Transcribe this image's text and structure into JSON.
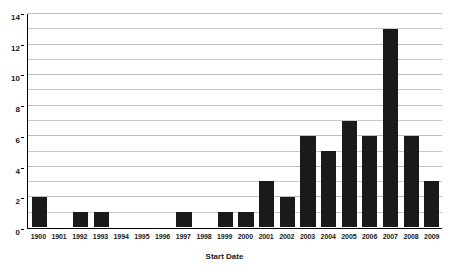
{
  "chart_data": {
    "type": "bar",
    "title": "",
    "xlabel": "Start Date",
    "ylabel": "",
    "categories": [
      "1900",
      "1901",
      "1992",
      "1993",
      "1994",
      "1995",
      "1996",
      "1997",
      "1998",
      "1999",
      "2000",
      "2001",
      "2002",
      "2003",
      "2004",
      "2005",
      "2006",
      "2007",
      "2008",
      "2009"
    ],
    "values": [
      2,
      0,
      1,
      1,
      0,
      0,
      0,
      1,
      0,
      1,
      1,
      3,
      2,
      6,
      5,
      7,
      6,
      13,
      6,
      3
    ],
    "ylim": [
      0,
      14
    ],
    "y_ticks": [
      0,
      2,
      4,
      6,
      8,
      10,
      12,
      14
    ],
    "y_tick_labels": [
      "0",
      "2",
      "4",
      "6",
      "8",
      "10",
      "12",
      "14"
    ],
    "gridlines": [
      1,
      2,
      3,
      4,
      5,
      6,
      7,
      8,
      9,
      10,
      11,
      12,
      13,
      14
    ],
    "grid": true,
    "legend": null,
    "bar_color": "#1a1a1a",
    "grid_color": "#c9c9c9",
    "axis_color": "#000000",
    "background": "#ffffff"
  }
}
